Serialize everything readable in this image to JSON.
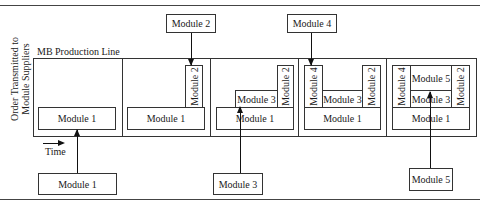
{
  "diagram": {
    "title": "MB Production Line",
    "y_axis_label_line1": "Order Transmitted to",
    "y_axis_label_line2": "Module Suppliers",
    "time_label": "Time",
    "colors": {
      "line": "#333333",
      "background": "#ffffff",
      "text": "#1a1a1a"
    },
    "incoming_top": [
      {
        "label": "Module 2",
        "panel": 2
      },
      {
        "label": "Module 4",
        "panel": 4
      }
    ],
    "incoming_bottom": [
      {
        "label": "Module 1",
        "panel": 1
      },
      {
        "label": "Module 3",
        "panel": 3
      },
      {
        "label": "Module 5",
        "panel": 5
      }
    ],
    "panels": [
      {
        "step": 1,
        "modules": {
          "m1": "Module 1"
        }
      },
      {
        "step": 2,
        "modules": {
          "m1": "Module 1",
          "m2": "Module 2"
        }
      },
      {
        "step": 3,
        "modules": {
          "m1": "Module 1",
          "m2": "Module 2",
          "m3": "Module 3"
        }
      },
      {
        "step": 4,
        "modules": {
          "m1": "Module 1",
          "m2": "Module 2",
          "m3": "Module 3",
          "m4": "Module 4"
        }
      },
      {
        "step": 5,
        "modules": {
          "m1": "Module 1",
          "m2": "Module 2",
          "m3": "Module 3",
          "m4": "Module 4",
          "m5": "Module 5"
        }
      }
    ]
  }
}
